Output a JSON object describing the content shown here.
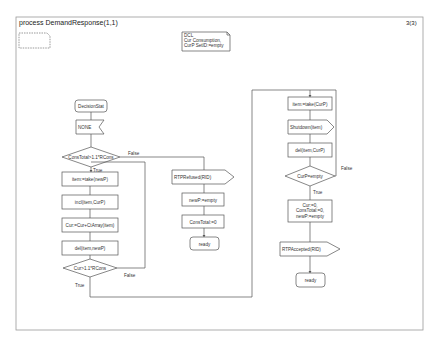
{
  "diagram": {
    "title": "process DemandResponse(1,1)",
    "page_indicator": "3(3)",
    "declaration": {
      "lines": [
        "DCL",
        "Cur Consumption,",
        "CurP SetID:=empty"
      ]
    },
    "start_state": "DecisionStat",
    "input_signal": "NONE",
    "decision_main": {
      "question": "ConsTotal>1.1*RCons",
      "true_label": "True",
      "false_label": "False"
    },
    "loop_tasks": [
      "item:=take(newP)",
      "incl(item,CurP)",
      "Cur:=Cur+CtArray(item)",
      "del(item,newP)"
    ],
    "decision_loop": {
      "question": "Cur>1.1*RCons",
      "true_label": "True",
      "false_label": "False"
    },
    "refused_branch": {
      "output_signal": "RTPRefused(RID)",
      "tasks": [
        "newP:=empty",
        "ConsTotal:=0"
      ],
      "next_state": "ready"
    },
    "shutdown_branch": {
      "tasks": [
        "item:=take(CurP)"
      ],
      "output_signal": "Shutdown(item)",
      "tasks_after": [
        "del(item,CurP)"
      ],
      "decision": {
        "question": "CurP=empty",
        "true_label": "True",
        "false_label": "False"
      },
      "reset_task": [
        "Cur:=0,",
        "ConsTotal:=0,",
        "newP:=empty"
      ],
      "accepted_signal": "RTPAccepted(RID)",
      "next_state": "ready"
    }
  }
}
